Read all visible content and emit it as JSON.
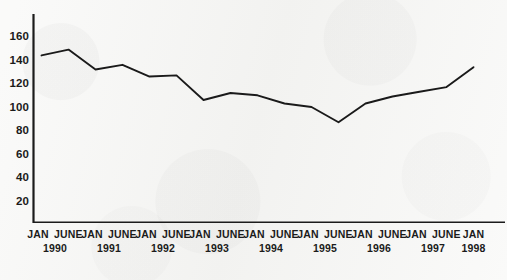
{
  "figure": {
    "background_color": "#f5f5f3",
    "line_color": "#1a1a1a",
    "axis_color": "#1b1b1b",
    "text_color": "#1b1b1b"
  },
  "chart_data": {
    "type": "line",
    "title": "",
    "subtitle": "",
    "xlabel": "",
    "ylabel": "",
    "ylim": [
      0,
      160
    ],
    "yticks": [
      20,
      40,
      60,
      80,
      100,
      120,
      140,
      160
    ],
    "ytick_labels": [
      "20",
      "40",
      "60",
      "80",
      "100",
      "120",
      "140",
      "160"
    ],
    "grid": false,
    "legend": false,
    "legend_position": "none",
    "axis_style": "left-and-bottom-spines",
    "categories": [
      "JAN 1990",
      "JUNE 1990",
      "JAN 1991",
      "JUNE 1991",
      "JAN 1992",
      "JUNE 1992",
      "JAN 1993",
      "JUNE 1993",
      "JAN 1994",
      "JUNE 1994",
      "JAN 1995",
      "JUNE 1995",
      "JAN 1996",
      "JUNE 1996",
      "JAN 1997",
      "JUNE 1997",
      "JAN 1998"
    ],
    "values": [
      145,
      150,
      133,
      137,
      127,
      128,
      107,
      113,
      111,
      104,
      101,
      88,
      104,
      110,
      114,
      118,
      135
    ],
    "x_axis_groups": [
      {
        "year": "1990",
        "months": [
          "JAN",
          "JUNE"
        ]
      },
      {
        "year": "1991",
        "months": [
          "JAN",
          "JUNE"
        ]
      },
      {
        "year": "1992",
        "months": [
          "JAN",
          "JUNE"
        ]
      },
      {
        "year": "1993",
        "months": [
          "JAN",
          "JUNE"
        ]
      },
      {
        "year": "1994",
        "months": [
          "JAN",
          "JUNE"
        ]
      },
      {
        "year": "1995",
        "months": [
          "JAN",
          "JUNE"
        ]
      },
      {
        "year": "1996",
        "months": [
          "JAN",
          "JUNE"
        ]
      },
      {
        "year": "1997",
        "months": [
          "JAN",
          "JUNE"
        ]
      },
      {
        "year": "1998",
        "months": [
          "JAN"
        ]
      }
    ]
  }
}
